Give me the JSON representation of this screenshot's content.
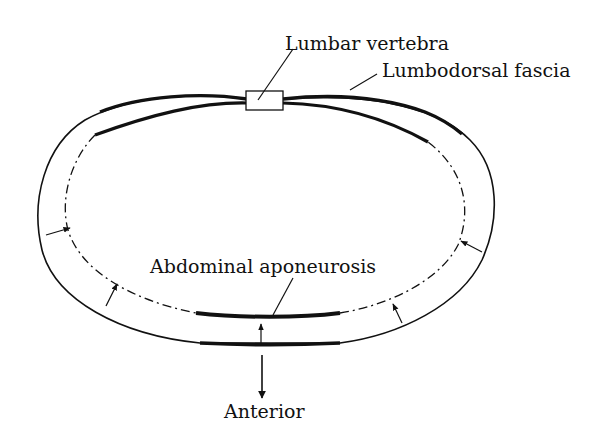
{
  "diagram": {
    "type": "anatomical cross-section",
    "labels": {
      "lumbar_vertebra": "Lumbar vertebra",
      "lumbodorsal_fascia": "Lumbodorsal fascia",
      "abdominal_aponeurosis": "Abdominal aponeurosis",
      "anterior": "Anterior"
    },
    "colors": {
      "ink": "#111111",
      "background": "#ffffff"
    }
  }
}
